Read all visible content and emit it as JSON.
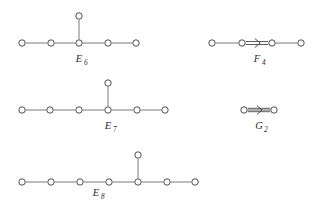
{
  "figure": {
    "background_color": "#ffffff",
    "node_fill": "#ffffff",
    "node_stroke": "#3a3a3a",
    "edge_color": "#6b6b6b",
    "label_color": "#2b2b2b",
    "node_radius": 3.2
  },
  "diagrams": [
    {
      "id": "e6",
      "label_base": "E",
      "label_subscript": "6",
      "label_full": "E6",
      "label_x": 79,
      "label_y": 62,
      "node_count": 6,
      "nodes": [
        {
          "name": "e6-node-1",
          "x": 22,
          "y": 43
        },
        {
          "name": "e6-node-2",
          "x": 51,
          "y": 43
        },
        {
          "name": "e6-node-3",
          "x": 79,
          "y": 43
        },
        {
          "name": "e6-node-4",
          "x": 108,
          "y": 43
        },
        {
          "name": "e6-node-5",
          "x": 136,
          "y": 43
        },
        {
          "name": "e6-node-branch",
          "x": 79,
          "y": 16
        }
      ],
      "edges": [
        {
          "name": "e6-edge-1-2",
          "x1": 22,
          "y1": 43,
          "x2": 51,
          "y2": 43,
          "kind": "single"
        },
        {
          "name": "e6-edge-2-3",
          "x1": 51,
          "y1": 43,
          "x2": 79,
          "y2": 43,
          "kind": "single"
        },
        {
          "name": "e6-edge-3-4",
          "x1": 79,
          "y1": 43,
          "x2": 108,
          "y2": 43,
          "kind": "single"
        },
        {
          "name": "e6-edge-4-5",
          "x1": 108,
          "y1": 43,
          "x2": 136,
          "y2": 43,
          "kind": "single"
        },
        {
          "name": "e6-edge-3-branch",
          "x1": 79,
          "y1": 43,
          "x2": 79,
          "y2": 16,
          "kind": "single"
        }
      ]
    },
    {
      "id": "f4",
      "label_base": "F",
      "label_subscript": "4",
      "label_full": "F4",
      "label_x": 257,
      "label_y": 62,
      "node_count": 4,
      "nodes": [
        {
          "name": "f4-node-1",
          "x": 212,
          "y": 43
        },
        {
          "name": "f4-node-2",
          "x": 242,
          "y": 43
        },
        {
          "name": "f4-node-3",
          "x": 272,
          "y": 43
        },
        {
          "name": "f4-node-4",
          "x": 301,
          "y": 43
        }
      ],
      "edges": [
        {
          "name": "f4-edge-1-2",
          "x1": 212,
          "y1": 43,
          "x2": 242,
          "y2": 43,
          "kind": "single"
        },
        {
          "name": "f4-edge-2-3",
          "x1": 242,
          "y1": 43,
          "x2": 272,
          "y2": 43,
          "kind": "double",
          "arrow": "right"
        },
        {
          "name": "f4-edge-3-4",
          "x1": 272,
          "y1": 43,
          "x2": 301,
          "y2": 43,
          "kind": "single"
        }
      ]
    },
    {
      "id": "e7",
      "label_base": "E",
      "label_subscript": "7",
      "label_full": "E7",
      "label_x": 108,
      "label_y": 129,
      "node_count": 7,
      "nodes": [
        {
          "name": "e7-node-1",
          "x": 22,
          "y": 110
        },
        {
          "name": "e7-node-2",
          "x": 50,
          "y": 110
        },
        {
          "name": "e7-node-3",
          "x": 79,
          "y": 110
        },
        {
          "name": "e7-node-4",
          "x": 108,
          "y": 110
        },
        {
          "name": "e7-node-5",
          "x": 137,
          "y": 110
        },
        {
          "name": "e7-node-6",
          "x": 165,
          "y": 110
        },
        {
          "name": "e7-node-branch",
          "x": 108,
          "y": 83
        }
      ],
      "edges": [
        {
          "name": "e7-edge-1-2",
          "x1": 22,
          "y1": 110,
          "x2": 50,
          "y2": 110,
          "kind": "single"
        },
        {
          "name": "e7-edge-2-3",
          "x1": 50,
          "y1": 110,
          "x2": 79,
          "y2": 110,
          "kind": "single"
        },
        {
          "name": "e7-edge-3-4",
          "x1": 79,
          "y1": 110,
          "x2": 108,
          "y2": 110,
          "kind": "single"
        },
        {
          "name": "e7-edge-4-5",
          "x1": 108,
          "y1": 110,
          "x2": 137,
          "y2": 110,
          "kind": "single"
        },
        {
          "name": "e7-edge-5-6",
          "x1": 137,
          "y1": 110,
          "x2": 165,
          "y2": 110,
          "kind": "single"
        },
        {
          "name": "e7-edge-4-branch",
          "x1": 108,
          "y1": 110,
          "x2": 108,
          "y2": 83,
          "kind": "single"
        }
      ]
    },
    {
      "id": "g2",
      "label_base": "G",
      "label_subscript": "2",
      "label_full": "G2",
      "label_x": 259,
      "label_y": 129,
      "node_count": 2,
      "nodes": [
        {
          "name": "g2-node-1",
          "x": 244,
          "y": 110
        },
        {
          "name": "g2-node-2",
          "x": 274,
          "y": 110
        }
      ],
      "edges": [
        {
          "name": "g2-edge-1-2",
          "x1": 244,
          "y1": 110,
          "x2": 274,
          "y2": 110,
          "kind": "triple",
          "arrow": "right"
        }
      ]
    },
    {
      "id": "e8",
      "label_base": "E",
      "label_subscript": "8",
      "label_full": "E8",
      "label_x": 96,
      "label_y": 196,
      "node_count": 8,
      "nodes": [
        {
          "name": "e8-node-1",
          "x": 22,
          "y": 182
        },
        {
          "name": "e8-node-2",
          "x": 51,
          "y": 182
        },
        {
          "name": "e8-node-3",
          "x": 80,
          "y": 182
        },
        {
          "name": "e8-node-4",
          "x": 109,
          "y": 182
        },
        {
          "name": "e8-node-5",
          "x": 138,
          "y": 182
        },
        {
          "name": "e8-node-6",
          "x": 167,
          "y": 182
        },
        {
          "name": "e8-node-7",
          "x": 195,
          "y": 182
        },
        {
          "name": "e8-node-branch",
          "x": 138,
          "y": 155
        }
      ],
      "edges": [
        {
          "name": "e8-edge-1-2",
          "x1": 22,
          "y1": 182,
          "x2": 51,
          "y2": 182,
          "kind": "single"
        },
        {
          "name": "e8-edge-2-3",
          "x1": 51,
          "y1": 182,
          "x2": 80,
          "y2": 182,
          "kind": "single"
        },
        {
          "name": "e8-edge-3-4",
          "x1": 80,
          "y1": 182,
          "x2": 109,
          "y2": 182,
          "kind": "single"
        },
        {
          "name": "e8-edge-4-5",
          "x1": 109,
          "y1": 182,
          "x2": 138,
          "y2": 182,
          "kind": "single"
        },
        {
          "name": "e8-edge-5-6",
          "x1": 138,
          "y1": 182,
          "x2": 167,
          "y2": 182,
          "kind": "single"
        },
        {
          "name": "e8-edge-6-7",
          "x1": 167,
          "y1": 182,
          "x2": 195,
          "y2": 182,
          "kind": "single"
        },
        {
          "name": "e8-edge-5-branch",
          "x1": 138,
          "y1": 182,
          "x2": 138,
          "y2": 155,
          "kind": "single"
        }
      ]
    }
  ]
}
